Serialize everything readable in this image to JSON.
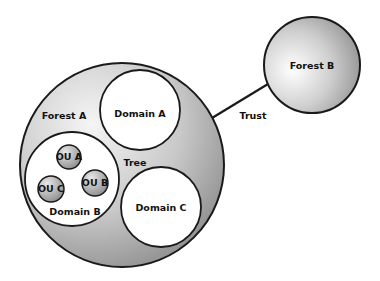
{
  "diagram": {
    "forest_a": {
      "label": "Forest A"
    },
    "forest_b": {
      "label": "Forest B"
    },
    "domain_a": {
      "label": "Domain A"
    },
    "domain_b": {
      "label": "Domain B"
    },
    "domain_c": {
      "label": "Domain C"
    },
    "ou_a": {
      "label": "OU A"
    },
    "ou_b": {
      "label": "OU B"
    },
    "ou_c": {
      "label": "OU C"
    },
    "tree": {
      "label": "Tree"
    },
    "trust": {
      "label": "Trust"
    }
  },
  "colors": {
    "outline": "#1a1a1a",
    "fill_light": "#f2f2f2",
    "fill_dark": "#8c8c8c",
    "domain_fill": "#ffffff"
  }
}
